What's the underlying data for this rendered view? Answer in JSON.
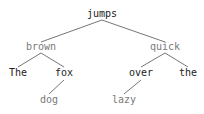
{
  "tree": {
    "title": "dependency tree",
    "colors": {
      "dark": "#222222",
      "gray": "#7a7a7a",
      "edge": "#666666"
    },
    "nodes": [
      {
        "id": "jumps",
        "label": "jumps",
        "x": 102,
        "y": 17,
        "tone": "dark"
      },
      {
        "id": "brown",
        "label": "brown",
        "x": 41,
        "y": 50,
        "tone": "gray"
      },
      {
        "id": "quick",
        "label": "quick",
        "x": 165,
        "y": 50,
        "tone": "gray"
      },
      {
        "id": "The",
        "label": "The",
        "x": 18,
        "y": 76,
        "tone": "dark"
      },
      {
        "id": "fox",
        "label": "fox",
        "x": 64,
        "y": 76,
        "tone": "dark"
      },
      {
        "id": "over",
        "label": "over",
        "x": 141,
        "y": 76,
        "tone": "dark"
      },
      {
        "id": "the",
        "label": "the",
        "x": 188,
        "y": 76,
        "tone": "dark"
      },
      {
        "id": "dog",
        "label": "dog",
        "x": 49,
        "y": 103,
        "tone": "gray"
      },
      {
        "id": "lazy",
        "label": "lazy",
        "x": 124,
        "y": 103,
        "tone": "gray"
      }
    ],
    "edges": [
      {
        "from": "jumps",
        "to": "brown",
        "x1": 102,
        "y1": 20,
        "x2": 41,
        "y2": 42
      },
      {
        "from": "jumps",
        "to": "quick",
        "x1": 102,
        "y1": 20,
        "x2": 165,
        "y2": 42
      },
      {
        "from": "brown",
        "to": "The",
        "x1": 41,
        "y1": 53,
        "x2": 18,
        "y2": 67
      },
      {
        "from": "brown",
        "to": "fox",
        "x1": 41,
        "y1": 53,
        "x2": 64,
        "y2": 67
      },
      {
        "from": "quick",
        "to": "over",
        "x1": 165,
        "y1": 53,
        "x2": 141,
        "y2": 67
      },
      {
        "from": "quick",
        "to": "the",
        "x1": 165,
        "y1": 53,
        "x2": 188,
        "y2": 67
      },
      {
        "from": "fox",
        "to": "dog",
        "x1": 64,
        "y1": 80,
        "x2": 49,
        "y2": 94
      },
      {
        "from": "over",
        "to": "lazy",
        "x1": 141,
        "y1": 80,
        "x2": 124,
        "y2": 94
      }
    ]
  }
}
